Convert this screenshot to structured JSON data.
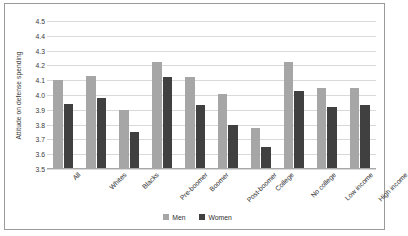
{
  "chart_data": {
    "type": "bar",
    "title": "",
    "xlabel": "",
    "ylabel": "Attitude on defense spending",
    "ylim": [
      3.5,
      4.5
    ],
    "ytick_step": 0.1,
    "yticks": [
      "4.5",
      "4.4",
      "4.3",
      "4.2",
      "4.1",
      "4.0",
      "3.9",
      "3.8",
      "3.7",
      "3.6",
      "3.5"
    ],
    "grid": true,
    "legend_position": "bottom-center",
    "categories": [
      "All",
      "Whites",
      "Blacks",
      "Pre-boomer",
      "Boomer",
      "Post-boomer",
      "College",
      "No college",
      "Low income",
      "High income"
    ],
    "series": [
      {
        "name": "Men",
        "color": "#a6a6a6",
        "values": [
          4.1,
          4.13,
          3.9,
          4.22,
          4.12,
          4.01,
          3.78,
          4.22,
          4.05,
          4.05
        ]
      },
      {
        "name": "Women",
        "color": "#404040",
        "values": [
          3.94,
          3.98,
          3.75,
          4.12,
          3.93,
          3.8,
          3.65,
          4.03,
          3.92,
          3.93
        ]
      }
    ]
  },
  "legend": {
    "items": [
      {
        "label": "Men",
        "color": "#a6a6a6"
      },
      {
        "label": "Women",
        "color": "#404040"
      }
    ]
  }
}
